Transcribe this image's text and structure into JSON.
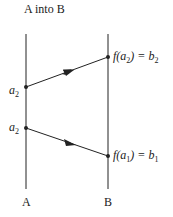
{
  "title": "A into B",
  "axes": {
    "left": {
      "label": "A"
    },
    "right": {
      "label": "B"
    }
  },
  "points": {
    "a_upper": {
      "base": "a",
      "sub": "2"
    },
    "a_lower": {
      "base": "a",
      "sub": "2"
    },
    "b_upper": {
      "fn": "f(a",
      "fn_sub": "2",
      "fn_close": ") = b",
      "sub": "2"
    },
    "b_lower": {
      "fn": "f(a",
      "fn_sub": "1",
      "fn_close": ") = b",
      "sub": "1"
    }
  },
  "colors": {
    "line": "#222222",
    "background": "#ffffff"
  }
}
